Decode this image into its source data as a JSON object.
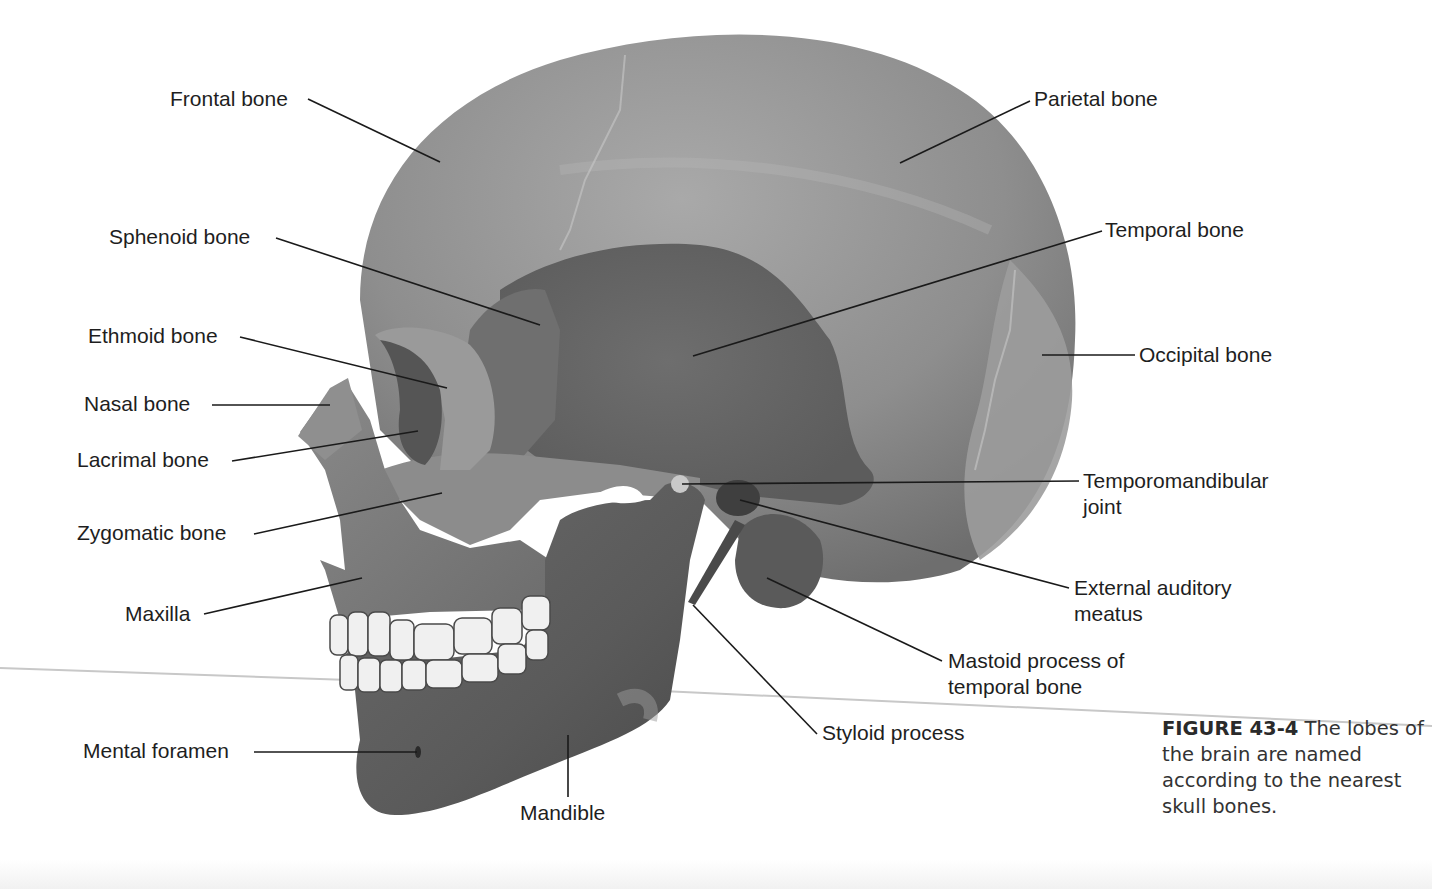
{
  "figure": {
    "number": "FIGURE 43-4",
    "caption_text": "The lobes of the brain are named according to the nearest skull bones."
  },
  "labels": {
    "frontal_bone": "Frontal bone",
    "parietal_bone": "Parietal bone",
    "sphenoid_bone": "Sphenoid bone",
    "temporal_bone": "Temporal bone",
    "ethmoid_bone": "Ethmoid bone",
    "occipital_bone": "Occipital bone",
    "nasal_bone": "Nasal bone",
    "lacrimal_bone": "Lacrimal bone",
    "tmj_line1": "Temporomandibular",
    "tmj_line2": "joint",
    "zygomatic_bone": "Zygomatic bone",
    "eam_line1": "External auditory",
    "eam_line2": "meatus",
    "maxilla": "Maxilla",
    "mastoid_line1": "Mastoid process of",
    "mastoid_line2": "temporal bone",
    "styloid_process": "Styloid process",
    "mental_foramen": "Mental foramen",
    "mandible": "Mandible"
  },
  "colors": {
    "bone_light": "#9a9a9a",
    "bone_mid": "#7d7d7d",
    "bone_dark": "#5e5e5e",
    "teeth": "#f2f2f2",
    "leader_line": "#1a1a1a",
    "text": "#1e1e1e"
  }
}
